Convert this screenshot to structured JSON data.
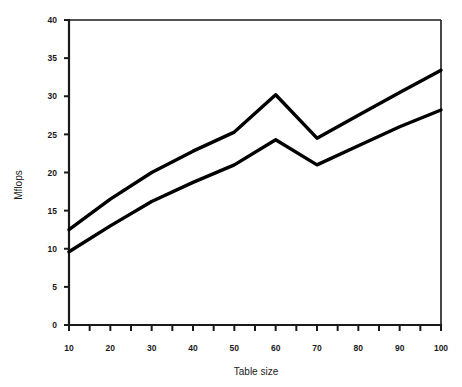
{
  "chart_data": {
    "type": "line",
    "title": "",
    "subtitle": "",
    "xlabel": "Table size",
    "ylabel": "Mflops",
    "xlim": [
      10,
      100
    ],
    "ylim": [
      0,
      40
    ],
    "grid": false,
    "legend": "none",
    "x": [
      10,
      20,
      30,
      40,
      50,
      60,
      70,
      80,
      90,
      100
    ],
    "xtick_labels": [
      "10",
      "20",
      "30",
      "40",
      "50",
      "60",
      "70",
      "80",
      "90",
      "100"
    ],
    "xtick_minor": [
      15,
      25,
      35,
      45,
      55,
      65,
      75,
      85,
      95
    ],
    "ytick_values": [
      0,
      5,
      10,
      15,
      20,
      25,
      30,
      35,
      40
    ],
    "ytick_labels": [
      "0",
      "5",
      "10",
      "15",
      "20",
      "25",
      "30",
      "35",
      "40"
    ],
    "series": [
      {
        "name": "upper",
        "color": "#000000",
        "values": [
          12.5,
          16.5,
          20.0,
          22.8,
          25.3,
          30.2,
          24.5,
          27.5,
          30.5,
          33.4
        ]
      },
      {
        "name": "lower",
        "color": "#000000",
        "values": [
          9.6,
          13.0,
          16.2,
          18.7,
          21.0,
          24.3,
          21.0,
          23.5,
          26.0,
          28.2
        ]
      }
    ],
    "annotations": []
  },
  "figure": {
    "background": "#ffffff",
    "axis_color": "#1a1a1a",
    "plot_left": 69,
    "plot_right": 441,
    "plot_top": 20,
    "plot_bottom": 325
  }
}
